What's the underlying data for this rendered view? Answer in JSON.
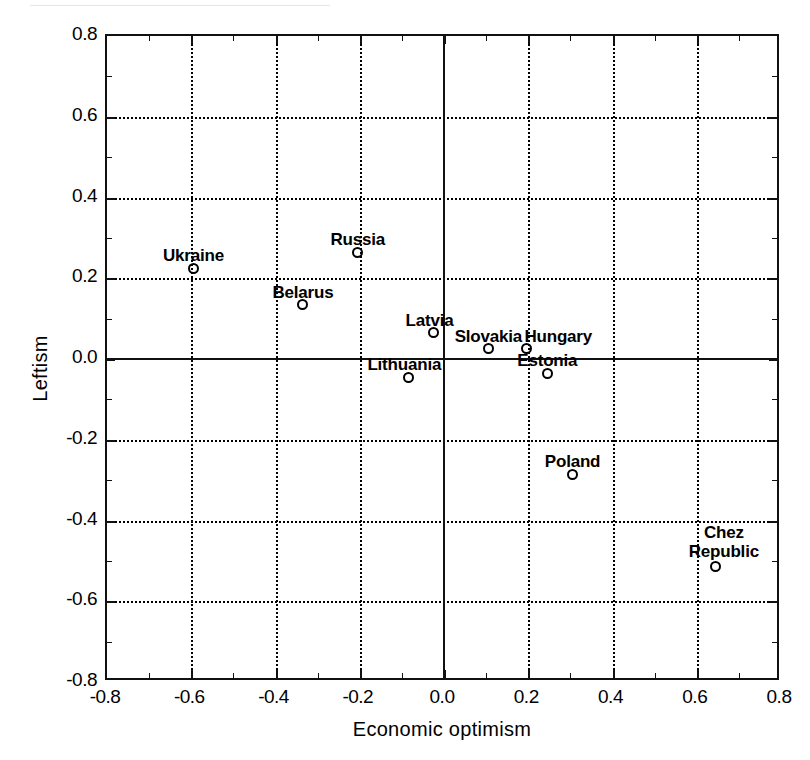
{
  "chart_data": {
    "type": "scatter",
    "title": "",
    "xlabel": "Economic optimism",
    "ylabel": "Leftism",
    "xlim": [
      -0.8,
      0.8
    ],
    "ylim": [
      -0.8,
      0.8
    ],
    "grid": true,
    "legend": "none",
    "marker": "open-circle",
    "xticks": [
      "-0.8",
      "-0.6",
      "-0.4",
      "-0.2",
      "0.0",
      "0.2",
      "0.4",
      "0.6",
      "0.8"
    ],
    "xtickvalues": [
      -0.8,
      -0.6,
      -0.4,
      -0.2,
      0.0,
      0.2,
      0.4,
      0.6,
      0.8
    ],
    "yticks": [
      "-0.8",
      "-0.6",
      "-0.4",
      "-0.2",
      "0.0",
      "0.2",
      "0.4",
      "0.6",
      "0.8"
    ],
    "ytickvalues": [
      -0.8,
      -0.6,
      -0.4,
      -0.2,
      0.0,
      0.2,
      0.4,
      0.6,
      0.8
    ],
    "minor_tick_step": 0.1,
    "points": [
      {
        "label": "Ukraine",
        "x": -0.59,
        "y": 0.22,
        "label_dx": 0,
        "label_dy": -22
      },
      {
        "label": "Russia",
        "x": -0.2,
        "y": 0.26,
        "label_dx": 0,
        "label_dy": -22
      },
      {
        "label": "Belarus",
        "x": -0.33,
        "y": 0.13,
        "label_dx": 0,
        "label_dy": -22
      },
      {
        "label": "Latvia",
        "x": -0.02,
        "y": 0.06,
        "label_dx": -4,
        "label_dy": -22
      },
      {
        "label": "Lithuania",
        "x": -0.08,
        "y": -0.05,
        "label_dx": -4,
        "label_dy": -22
      },
      {
        "label": "Slovakia",
        "x": 0.11,
        "y": 0.02,
        "label_dx": 0,
        "label_dy": -22
      },
      {
        "label": "Hungary",
        "x": 0.2,
        "y": 0.02,
        "label_dx": 32,
        "label_dy": -22
      },
      {
        "label": "Estonia",
        "x": 0.25,
        "y": -0.04,
        "label_dx": 0,
        "label_dy": -22
      },
      {
        "label": "Poland",
        "x": 0.31,
        "y": -0.29,
        "label_dx": 0,
        "label_dy": -22
      },
      {
        "label": "Chez Republic",
        "x": 0.65,
        "y": -0.52,
        "label_dx": 8,
        "label_dy": -44,
        "wrap": true
      }
    ]
  }
}
